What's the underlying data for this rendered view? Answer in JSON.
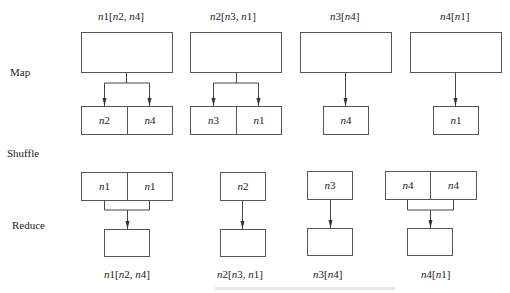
{
  "diagram": {
    "stages": {
      "map": "Map",
      "shuffle": "Shuffle",
      "reduce": "Reduce"
    },
    "map_inputs": [
      {
        "node": "n1",
        "neighbors": "n2, n4",
        "label": "n1[n2, n4]"
      },
      {
        "node": "n2",
        "neighbors": "n3, n1",
        "label": "n2[n3, n1]"
      },
      {
        "node": "n3",
        "neighbors": "n4",
        "label": "n3[n4]"
      },
      {
        "node": "n4",
        "neighbors": "n1",
        "label": "n4[n1]"
      }
    ],
    "map_outputs": [
      [
        "n2",
        "n4"
      ],
      [
        "n3",
        "n1"
      ],
      [
        "n4"
      ],
      [
        "n1"
      ]
    ],
    "shuffle_groups": [
      [
        "n1",
        "n1"
      ],
      [
        "n2"
      ],
      [
        "n3"
      ],
      [
        "n4",
        "n4"
      ]
    ],
    "reduce_outputs": [
      {
        "label": "n1[n2, n4]"
      },
      {
        "label": "n2[n3, n1]"
      },
      {
        "label": "n3[n4]"
      },
      {
        "label": "n4[n1]"
      }
    ]
  }
}
